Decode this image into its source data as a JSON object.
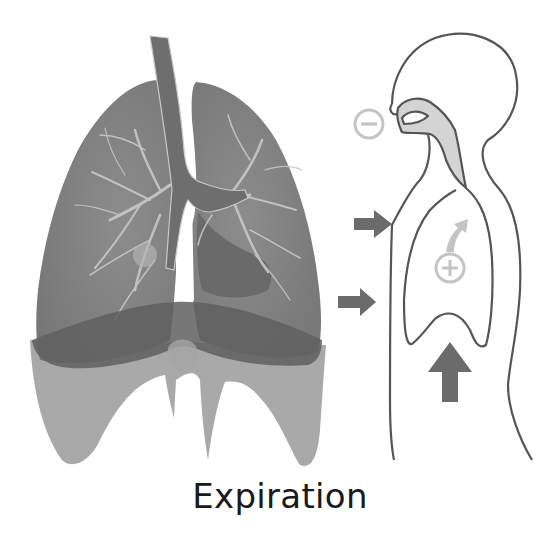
{
  "diagram": {
    "title": "Expiration",
    "phase": "expiration",
    "colors": {
      "background": "#ffffff",
      "lung_fill": "#7b7b7b",
      "lung_dark": "#6a6a6a",
      "bronchi_light": "#c8c8c8",
      "diaphragm_relaxed": "#9a9a9a",
      "diaphragm_contracted": "#5f5f5f",
      "outline": "#555555",
      "airway_fill": "#d4d4d4",
      "arrow": "#6b6b6b",
      "pressure_symbol": "#c4c4c4",
      "text": "#1a1a1a"
    },
    "lungs": {
      "label": "lungs",
      "parts": [
        "trachea",
        "left lung",
        "right lung",
        "bronchial tree",
        "diaphragm"
      ]
    },
    "body_profile": {
      "label": "human profile",
      "symbols": [
        {
          "name": "minus",
          "glyph": "−",
          "meaning": "lower pressure outside (near mouth)"
        },
        {
          "name": "plus",
          "glyph": "+",
          "meaning": "higher pressure inside lungs"
        }
      ],
      "arrows": [
        {
          "name": "chest-wall-arrow-upper",
          "direction": "right"
        },
        {
          "name": "chest-wall-arrow-lower",
          "direction": "right"
        },
        {
          "name": "diaphragm-arrow",
          "direction": "up"
        },
        {
          "name": "airflow-arrow",
          "direction": "up-right"
        }
      ]
    }
  }
}
